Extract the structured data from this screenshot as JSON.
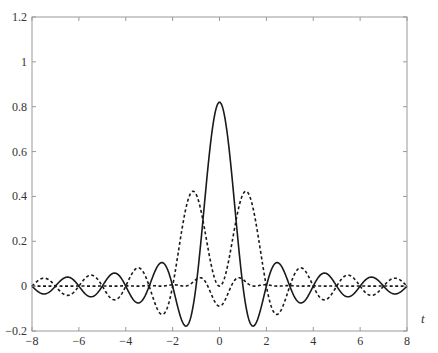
{
  "chart_data": {
    "type": "line",
    "title": "",
    "xlabel": "t",
    "ylabel": "",
    "xlim": [
      -8,
      8
    ],
    "ylim": [
      -0.2,
      1.2
    ],
    "grid": false,
    "legend": null,
    "x_ticks": [
      -8,
      -6,
      -4,
      -2,
      0,
      2,
      4,
      6,
      8
    ],
    "x_tick_labels": [
      "−8",
      "−6",
      "−4",
      "−2",
      "0",
      "2",
      "4",
      "6",
      "8"
    ],
    "y_ticks": [
      -0.2,
      0,
      0.2,
      0.4,
      0.6,
      0.8,
      1,
      1.2
    ],
    "y_tick_labels": [
      "−0.2",
      "0",
      "0.2",
      "0.4",
      "0.6",
      "0.8",
      "1",
      "1.2"
    ],
    "series": [
      {
        "name": "solid",
        "style": "solid",
        "description": "central lobe peak 0.82 at t=0, minima about -0.16 at t=±1.4",
        "x": [
          -8,
          -7.5,
          -7,
          -6.5,
          -6,
          -5.5,
          -5,
          -4.5,
          -4,
          -3.5,
          -3,
          -2.5,
          -2,
          -1.5,
          -1,
          -0.5,
          0,
          0.5,
          1,
          1.5,
          2,
          2.5,
          3,
          3.5,
          4,
          4.5,
          5,
          5.5,
          6,
          6.5,
          7,
          7.5,
          8
        ],
        "values": [
          0,
          -0.035,
          0,
          0.04,
          0,
          -0.047,
          0,
          0.058,
          0,
          -0.075,
          0,
          0.104,
          0,
          -0.174,
          0,
          0.522,
          0.82,
          0.522,
          0,
          -0.174,
          0,
          0.104,
          0,
          -0.075,
          0,
          0.058,
          0,
          -0.047,
          0,
          0.04,
          0,
          -0.035,
          0
        ]
      },
      {
        "name": "dashed-large",
        "style": "dashed",
        "description": "peaks about 0.41 at t=±1",
        "x": [
          -8,
          -7.5,
          -7,
          -6.5,
          -6,
          -5.5,
          -5,
          -4.5,
          -4,
          -3.5,
          -3,
          -2.5,
          -2,
          -1.5,
          -1,
          -0.5,
          0,
          0.5,
          1,
          1.5,
          2,
          2.5,
          3,
          3.5,
          4,
          4.5,
          5,
          5.5,
          6,
          6.5,
          7,
          7.5,
          8
        ],
        "values": [
          0,
          0.012,
          0,
          -0.015,
          0,
          0.02,
          0,
          -0.026,
          0,
          0.036,
          0,
          -0.06,
          0,
          0.25,
          0.41,
          0.25,
          0,
          0.25,
          0.41,
          0.25,
          0,
          -0.06,
          0,
          0.036,
          0,
          -0.026,
          0,
          0.02,
          0,
          -0.015,
          0,
          0.012,
          0
        ]
      },
      {
        "name": "dashed-small",
        "style": "dashed",
        "description": "small oscillation, amplitude about 0.04-0.05",
        "x": [
          -8,
          -7,
          -6,
          -5,
          -4,
          -3,
          -2,
          -1,
          0,
          1,
          2,
          3,
          4,
          5,
          6,
          7,
          8
        ],
        "values": [
          0,
          0.02,
          -0.02,
          0.03,
          -0.03,
          0.045,
          -0.05,
          0.05,
          -0.07,
          0.05,
          -0.05,
          0.045,
          -0.03,
          0.03,
          -0.02,
          0.02,
          0
        ]
      }
    ]
  },
  "colors": {
    "axis": "#999999",
    "curve": "#1a1a1a",
    "text": "#333333"
  }
}
